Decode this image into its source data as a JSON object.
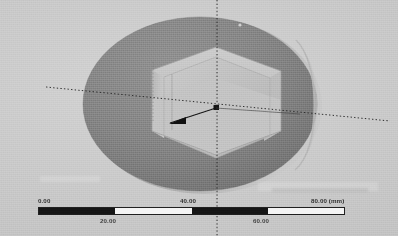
{
  "viewport": {
    "name": "cad-3d-viewport",
    "width": 398,
    "height": 236,
    "background_color": "#c9c9c9",
    "units": "mm"
  },
  "model": {
    "name": "hexagonal-socket-disc",
    "description": "Cylindrical disc with hexagonal through-pocket shown in isometric view",
    "body_color": "#7e7e7e",
    "cavity_wall_color": "#c3c3c3",
    "cavity_floor_color": "#b6b6b6",
    "edge_color": "#9a9a9a",
    "rim_highlight_color": "#b9b9b9"
  },
  "axes": {
    "name": "triad-axes",
    "style": "dotted",
    "color": "#262626",
    "origin": {
      "x": 216,
      "y": 108
    },
    "vertical_label": "",
    "horizontal_label": ""
  },
  "direction_arrow": {
    "name": "direction-arrow",
    "color": "#111111",
    "from": {
      "x": 216,
      "y": 108
    },
    "to": {
      "x": 166,
      "y": 124
    }
  },
  "scale_bar": {
    "name": "scale-bar",
    "unit_label": "(mm)",
    "segments": [
      {
        "value": 0.0,
        "filled": true
      },
      {
        "value": 20.0,
        "filled": false
      },
      {
        "value": 40.0,
        "filled": true
      },
      {
        "value": 60.0,
        "filled": false
      }
    ],
    "ticks_top": [
      {
        "label": "0.00",
        "x": 38,
        "align": "left"
      },
      {
        "label": "40.00",
        "x": 192,
        "align": "center"
      },
      {
        "label": "80.00",
        "x": 345,
        "align": "right"
      }
    ],
    "ticks_bottom": [
      {
        "label": "20.00",
        "x": 115,
        "align": "center"
      },
      {
        "label": "60.00",
        "x": 268,
        "align": "center"
      }
    ],
    "min": "0.00",
    "mid_low": "20.00",
    "mid": "40.00",
    "mid_high": "60.00",
    "max": "80.00",
    "max_with_unit": "80.00 (mm)"
  }
}
